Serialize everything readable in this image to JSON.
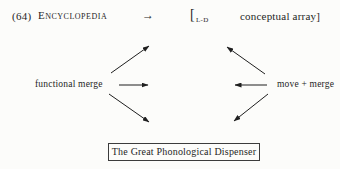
{
  "colors": {
    "background": "#fcfcfa",
    "ink": "#1f1f1f",
    "box_border": "#3c3c3c"
  },
  "top_line": {
    "example_number": "(64)",
    "lexicon_label": "Encyclopedia",
    "maps_to_glyph": "→",
    "bracket_open": "[",
    "bracket_subscript": "L-D",
    "bracket_content": "conceptual array]"
  },
  "nodes": {
    "left_label": "functional merge",
    "right_label": "move + merge",
    "bottom_box_label": "The Great Phonological Dispenser"
  },
  "arrows": [
    {
      "name": "left-up-diagonal-arrow",
      "x1": 111,
      "y1": 73,
      "x2": 149,
      "y2": 46
    },
    {
      "name": "left-horizontal-arrow",
      "x1": 119,
      "y1": 85,
      "x2": 148,
      "y2": 85
    },
    {
      "name": "left-down-diagonal-arrow",
      "x1": 109,
      "y1": 94,
      "x2": 149,
      "y2": 122
    },
    {
      "name": "right-up-diagonal-arrow",
      "x1": 265,
      "y1": 74,
      "x2": 227,
      "y2": 47
    },
    {
      "name": "right-horizontal-arrow",
      "x1": 267,
      "y1": 85,
      "x2": 235,
      "y2": 85
    },
    {
      "name": "right-down-diagonal-arrow",
      "x1": 268,
      "y1": 94,
      "x2": 234,
      "y2": 121
    }
  ]
}
